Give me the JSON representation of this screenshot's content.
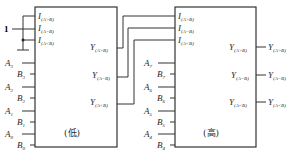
{
  "diagram": {
    "constant_input": "1",
    "low_chip": {
      "label": "(低)",
      "cascade_inputs": [
        {
          "name": "I",
          "sub": "(A>B)"
        },
        {
          "name": "I",
          "sub": "(A=B)"
        },
        {
          "name": "I",
          "sub": "(A<B)"
        }
      ],
      "data_inputs": [
        {
          "name": "A",
          "sub": "3"
        },
        {
          "name": "B",
          "sub": "3"
        },
        {
          "name": "A",
          "sub": "2"
        },
        {
          "name": "B",
          "sub": "2"
        },
        {
          "name": "A",
          "sub": "1"
        },
        {
          "name": "B",
          "sub": "1"
        },
        {
          "name": "A",
          "sub": "0"
        },
        {
          "name": "B",
          "sub": "0"
        }
      ],
      "outputs": [
        {
          "name": "Y",
          "sub": "(A>B)"
        },
        {
          "name": "Y",
          "sub": "(A=B)"
        },
        {
          "name": "Y",
          "sub": "(A<B)"
        }
      ]
    },
    "high_chip": {
      "label": "(高)",
      "cascade_inputs": [
        {
          "name": "I",
          "sub": "(A>B)"
        },
        {
          "name": "I",
          "sub": "(A=B)"
        },
        {
          "name": "I",
          "sub": "(A<B)"
        }
      ],
      "data_inputs": [
        {
          "name": "A",
          "sub": "7"
        },
        {
          "name": "B",
          "sub": "7"
        },
        {
          "name": "A",
          "sub": "6"
        },
        {
          "name": "B",
          "sub": "6"
        },
        {
          "name": "A",
          "sub": "5"
        },
        {
          "name": "B",
          "sub": "5"
        },
        {
          "name": "A",
          "sub": "4"
        },
        {
          "name": "B",
          "sub": "4"
        }
      ],
      "outputs": [
        {
          "name": "Y",
          "sub": "(A>B)"
        },
        {
          "name": "Y",
          "sub": "(A=B)"
        },
        {
          "name": "Y",
          "sub": "(A<B)"
        }
      ]
    },
    "final_outputs": [
      {
        "name": "Y",
        "sub": "(A>B)"
      },
      {
        "name": "Y",
        "sub": "(A=B)"
      },
      {
        "name": "Y",
        "sub": "(A<B)"
      }
    ]
  }
}
